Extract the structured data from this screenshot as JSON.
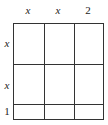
{
  "diagram": {
    "type": "area-model-grid",
    "column_labels": [
      "x",
      "x",
      "2"
    ],
    "row_labels": [
      "x",
      "x",
      "1"
    ],
    "line_color": "#333333"
  }
}
